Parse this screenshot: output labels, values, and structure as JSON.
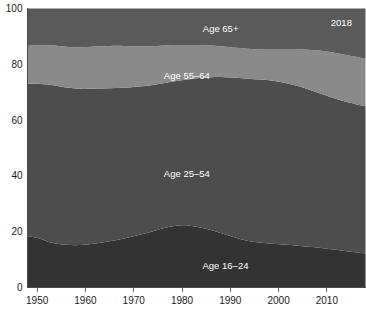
{
  "chart_data": {
    "type": "area",
    "title": "",
    "subtitle": "",
    "xlabel": "",
    "ylabel": "",
    "stacked": true,
    "stack_mode": "percent",
    "grid": false,
    "legend_position": "inline-labels",
    "xlim": [
      1948,
      2018
    ],
    "ylim": [
      0,
      100
    ],
    "x_ticks": [
      1950,
      1960,
      1970,
      1980,
      1990,
      2000,
      2010
    ],
    "x_tick_labels": [
      "1950",
      "1960",
      "1970",
      "1980",
      "1990",
      "2000",
      "2010"
    ],
    "y_ticks": [
      0,
      20,
      40,
      60,
      80,
      100
    ],
    "y_tick_labels": [
      "0",
      "20",
      "40",
      "60",
      "80",
      "100"
    ],
    "x": [
      1948,
      1950,
      1953,
      1956,
      1959,
      1962,
      1965,
      1968,
      1971,
      1974,
      1977,
      1980,
      1983,
      1986,
      1989,
      1992,
      1995,
      1998,
      2001,
      2004,
      2007,
      2010,
      2013,
      2016,
      2018
    ],
    "series": [
      {
        "name": "Age 16–24",
        "label": "Age 16–24",
        "color": "#333333",
        "label_x": 1989,
        "label_y": 8,
        "values": [
          18.5,
          17.8,
          16.0,
          15.3,
          15.2,
          15.8,
          16.6,
          17.6,
          18.8,
          20.2,
          21.6,
          22.3,
          21.8,
          20.6,
          19.0,
          17.4,
          16.3,
          15.8,
          15.4,
          15.0,
          14.5,
          13.9,
          13.3,
          12.6,
          12.2
        ]
      },
      {
        "name": "Age 25–54",
        "label": "Age 25–54",
        "color": "#4d4d4d",
        "label_x": 1981,
        "label_y": 41,
        "values": [
          54.5,
          55.2,
          56.6,
          56.4,
          56.0,
          55.5,
          54.8,
          54.0,
          53.2,
          52.4,
          51.9,
          52.0,
          53.2,
          54.8,
          56.4,
          57.7,
          58.3,
          58.5,
          58.1,
          57.2,
          56.0,
          54.8,
          53.7,
          53.1,
          52.8
        ]
      },
      {
        "name": "Age 55–64",
        "label": "Age 55–64",
        "color": "#8a8a8a",
        "label_x": 1981,
        "label_y": 76,
        "values": [
          13.6,
          13.8,
          14.2,
          14.6,
          14.9,
          15.1,
          15.2,
          15.0,
          14.5,
          13.9,
          13.3,
          12.6,
          11.9,
          11.3,
          10.9,
          10.7,
          10.8,
          11.2,
          12.0,
          13.2,
          14.6,
          15.9,
          16.7,
          17.0,
          17.0
        ]
      },
      {
        "name": "Age 65+",
        "label": "Age 65+",
        "color": "#5a5a5a",
        "label_x": 1988,
        "label_y": 93,
        "values": [
          13.4,
          13.2,
          13.2,
          13.7,
          13.9,
          13.6,
          13.4,
          13.4,
          13.5,
          13.5,
          13.2,
          13.1,
          13.1,
          13.3,
          13.7,
          14.2,
          14.6,
          14.5,
          14.5,
          14.6,
          14.9,
          15.4,
          16.3,
          17.3,
          18.0
        ]
      }
    ],
    "annotations": [
      {
        "text": "2018",
        "x": 2013,
        "y": 95
      }
    ]
  },
  "colors": {
    "background": "#ffffff",
    "axis": "#4d4d4d",
    "tick_text": "#1a1a1a",
    "series_label": "#ffffff"
  }
}
